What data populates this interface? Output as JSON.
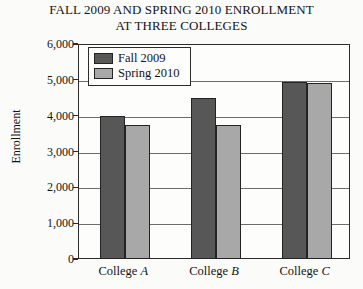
{
  "chart_data": {
    "type": "bar",
    "title": "FALL 2009 AND SPRING 2010 ENROLLMENT AT THREE COLLEGES",
    "title_lines": [
      "FALL 2009 AND SPRING 2010 ENROLLMENT",
      "AT THREE COLLEGES"
    ],
    "xlabel": "",
    "ylabel": "Enrollment",
    "ylim": [
      0,
      6000
    ],
    "ytick_step": 1000,
    "grid": true,
    "legend_position": "upper-left-inside",
    "categories": [
      "College A",
      "College B",
      "College C"
    ],
    "category_parts": [
      {
        "name": "College",
        "letter": "A"
      },
      {
        "name": "College",
        "letter": "B"
      },
      {
        "name": "College",
        "letter": "C"
      }
    ],
    "ytick_labels": [
      "6,000",
      "5,000",
      "4,000",
      "3,000",
      "2,000",
      "1,000",
      "0"
    ],
    "ytick_values": [
      6000,
      5000,
      4000,
      3000,
      2000,
      1000,
      0
    ],
    "series": [
      {
        "name": "Fall 2009",
        "color": "#575757",
        "values": [
          4000,
          4500,
          4950
        ]
      },
      {
        "name": "Spring 2010",
        "color": "#a8a8a8",
        "values": [
          3750,
          3750,
          4900
        ]
      }
    ]
  },
  "colors": {
    "axis": "#2b2b2b",
    "grid": "#6d6d6d",
    "background": "#fbfbf9",
    "plot_background": "#fdfdfb",
    "text": "#141414"
  }
}
